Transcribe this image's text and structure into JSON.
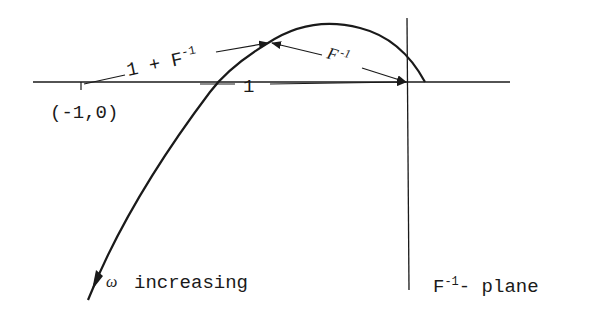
{
  "diagram": {
    "colors": {
      "ink": "#1a1a1a",
      "background": "#ffffff"
    },
    "labels": {
      "critical_point": "(-1,0)",
      "vector_sum": "1 + F",
      "vector_sum_sup": "-1",
      "unit_vector": "1",
      "inverse_vector": "F",
      "inverse_vector_sup": "-1",
      "omega_symbol": "ω",
      "direction": "increasing",
      "plane_name_base": "F",
      "plane_name_sup": "-1",
      "plane_name_suffix": "- plane"
    }
  }
}
